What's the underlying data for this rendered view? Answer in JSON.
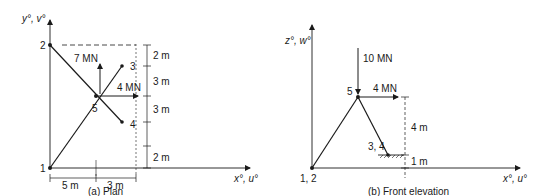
{
  "plan": {
    "caption": "(a)  Plan",
    "y_axis_label": "y°, v°",
    "x_axis_label": "x°, u°",
    "nodes": {
      "n1": "1",
      "n2": "2",
      "n3": "3",
      "n4": "4",
      "n5": "5"
    },
    "loads": {
      "load_7": "7 MN",
      "load_4": "4 MN"
    },
    "vertical_dims": [
      "2 m",
      "3 m",
      "3 m",
      "2 m"
    ],
    "horizontal_dims": [
      "5 m",
      "3 m"
    ]
  },
  "front_elevation": {
    "caption": "(b)  Front elevation",
    "z_axis_label": "z°, w°",
    "x_axis_label": "x°, u°",
    "nodes": {
      "n12": "1, 2",
      "n34": "3, 4",
      "n5": "5"
    },
    "loads": {
      "load_10": "10 MN",
      "load_4": "4 MN"
    },
    "vertical_dims": [
      "4 m",
      "1 m"
    ]
  }
}
